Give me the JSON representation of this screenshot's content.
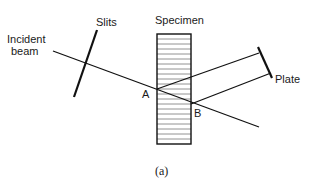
{
  "labels": {
    "incident_beam_line1": "Incident",
    "incident_beam_line2": "beam",
    "slits": "Slits",
    "specimen": "Specimen",
    "point_a": "A",
    "point_b": "B",
    "plate": "Plate",
    "caption": "(a)"
  },
  "colors": {
    "stroke": "#111111",
    "hatch": "#777777",
    "background": "#ffffff"
  },
  "geometry": {
    "specimen_rect": {
      "x": 157,
      "y": 34,
      "w": 34,
      "h": 110
    },
    "hatch_spacing": 5,
    "incident_beam": {
      "x1": 53,
      "y1": 51,
      "x2": 259,
      "y2": 127
    },
    "slit": {
      "x1": 97,
      "y1": 30,
      "x2": 74,
      "y2": 97
    },
    "diffracted_ray_a": {
      "x1": 157,
      "y1": 89,
      "x2": 259,
      "y2": 53
    },
    "diffracted_ray_b": {
      "x1": 191,
      "y1": 104,
      "x2": 271,
      "y2": 73
    },
    "plate": {
      "x1": 258,
      "y1": 47,
      "x2": 272,
      "y2": 78
    }
  }
}
